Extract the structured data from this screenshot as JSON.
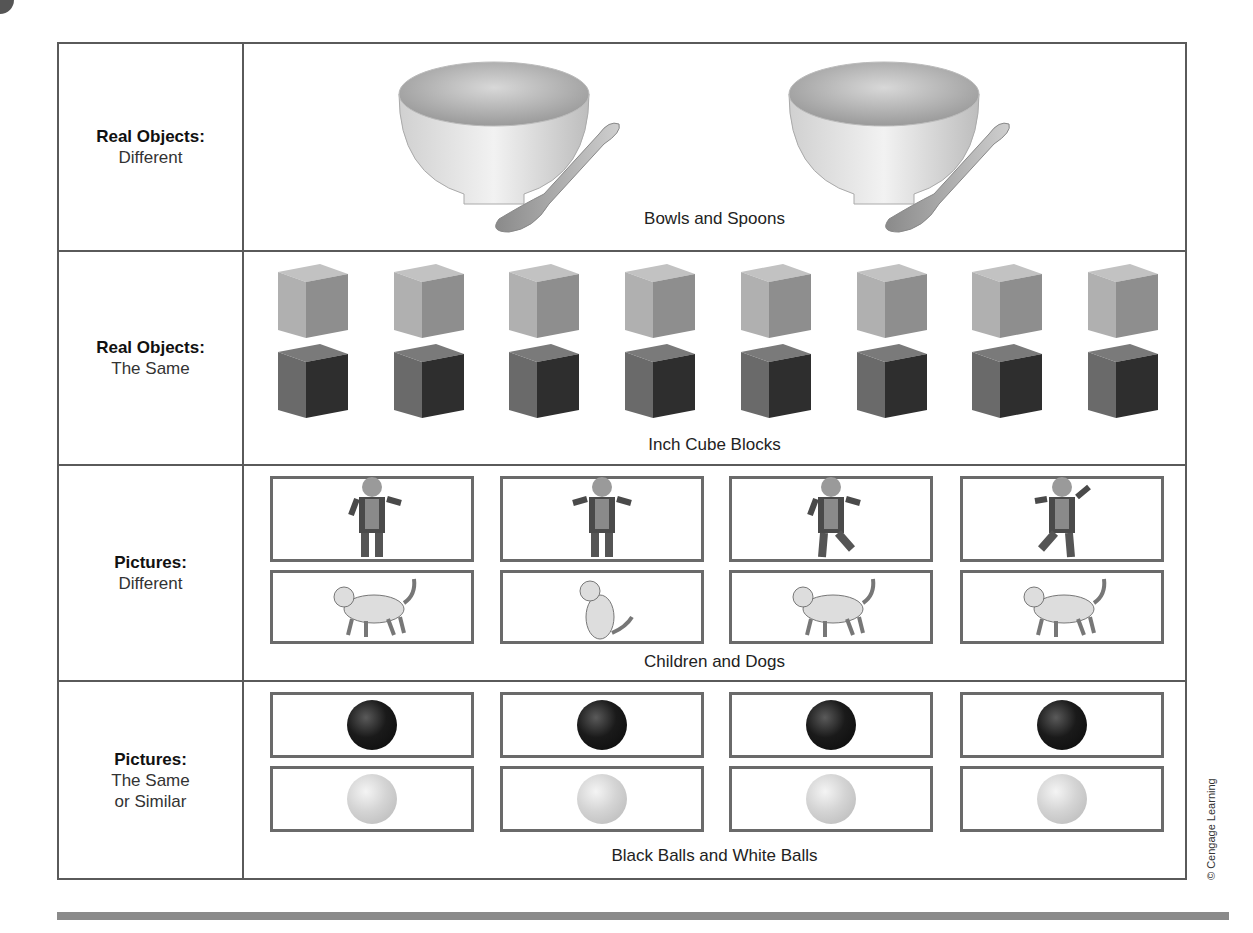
{
  "rows": [
    {
      "label_bold": "Real Objects:",
      "label_sub": "Different",
      "caption": "Bowls and Spoons",
      "items": [
        "bowl-and-spoon",
        "bowl-and-spoon"
      ]
    },
    {
      "label_bold": "Real Objects:",
      "label_sub": "The Same",
      "caption": "Inch Cube Blocks",
      "items": {
        "top": "light-gray-cube",
        "bottom": "dark-gray-cube",
        "count_per_row": 8
      }
    },
    {
      "label_bold": "Pictures:",
      "label_sub": "Different",
      "caption": "Children and Dogs",
      "items": {
        "top": [
          "child-arm-out",
          "child-arms-out",
          "child-walking",
          "child-jumping"
        ],
        "bottom": [
          "dog-walking",
          "dog-sitting",
          "dog-leaping",
          "dog-running"
        ]
      }
    },
    {
      "label_bold": "Pictures:",
      "label_sub_line1": "The Same",
      "label_sub_line2": "or Similar",
      "caption": "Black Balls and White Balls",
      "items": {
        "top": "black-ball",
        "bottom": "white-ball",
        "count_per_row": 4
      }
    }
  ],
  "copyright": "© Cengage Learning",
  "colors": {
    "border": "#5a5a5a",
    "cube_light": "#b5b5b5",
    "cube_dark": "#6e6e6e",
    "rule": "#8a8a8a"
  }
}
